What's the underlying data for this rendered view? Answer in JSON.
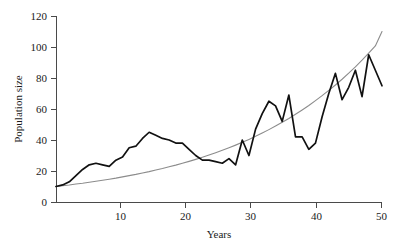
{
  "chart_data": {
    "type": "line",
    "title": "",
    "xlabel": "Years",
    "ylabel": "Population size",
    "xlim": [
      1,
      50
    ],
    "ylim": [
      0,
      120
    ],
    "xticks": [
      10,
      20,
      30,
      40,
      50
    ],
    "yticks": [
      0,
      20,
      40,
      60,
      80,
      100,
      120
    ],
    "xtick_labels": [
      "10",
      "20",
      "30",
      "40",
      "50"
    ],
    "ytick_labels": [
      "0",
      "20",
      "40",
      "60",
      "80",
      "100",
      "120"
    ],
    "grid": false,
    "legend": null,
    "legend_position": "none",
    "colors": {
      "stochastic": "#111111",
      "deterministic": "#8c8c8c",
      "axis": "#4a4a4a",
      "background": "#ffffff"
    },
    "x": [
      1,
      2,
      3,
      4,
      5,
      6,
      7,
      8,
      9,
      10,
      11,
      12,
      13,
      14,
      15,
      16,
      17,
      18,
      19,
      20,
      21,
      22,
      23,
      24,
      25,
      26,
      27,
      28,
      29,
      30,
      31,
      32,
      33,
      34,
      35,
      36,
      37,
      38,
      39,
      40,
      41,
      42,
      43,
      44,
      45,
      46,
      47,
      48,
      49,
      50
    ],
    "series": [
      {
        "name": "stochastic-population",
        "style": "jagged-black",
        "values": [
          10,
          11,
          13,
          17,
          21,
          24,
          25,
          24,
          23,
          27,
          29,
          35,
          36,
          41,
          45,
          43,
          41,
          40,
          38,
          38,
          34,
          30,
          27,
          27,
          26,
          25,
          28,
          24,
          40,
          30,
          47,
          57,
          65,
          62,
          52,
          69,
          42,
          42,
          34,
          38,
          55,
          70,
          83,
          66,
          74,
          85,
          68,
          95,
          85,
          75
        ]
      },
      {
        "name": "deterministic-exponential",
        "style": "smooth-gray",
        "values": [
          10,
          10.5,
          11.0,
          11.6,
          12.1,
          12.7,
          13.4,
          14.0,
          14.7,
          15.4,
          16.2,
          17.0,
          17.8,
          18.7,
          19.6,
          20.6,
          21.6,
          22.7,
          23.8,
          25.0,
          26.2,
          27.5,
          28.9,
          30.3,
          31.8,
          33.4,
          35.0,
          36.7,
          38.5,
          40.4,
          42.4,
          44.5,
          46.7,
          49.0,
          51.4,
          53.9,
          56.6,
          59.4,
          62.3,
          65.4,
          68.6,
          72.0,
          75.5,
          79.2,
          83.1,
          87.2,
          91.5,
          96.0,
          100.7,
          110.0
        ]
      }
    ]
  }
}
